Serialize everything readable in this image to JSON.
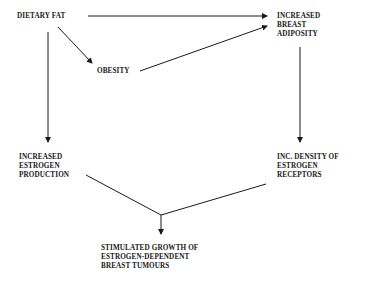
{
  "diagram": {
    "type": "flowchart",
    "nodes": {
      "dietary_fat": {
        "lines": [
          "DIETARY FAT"
        ]
      },
      "obesity": {
        "lines": [
          "OBESITY"
        ]
      },
      "breast_adiposity": {
        "lines": [
          "INCREASED",
          "BREAST",
          "ADIPOSITY"
        ]
      },
      "estrogen_production": {
        "lines": [
          "INCREASED",
          "ESTROGEN",
          "PRODUCTION"
        ]
      },
      "receptor_density": {
        "lines": [
          "INC. DENSITY OF",
          "ESTROGEN",
          "RECEPTORS"
        ]
      },
      "tumour_growth": {
        "lines": [
          "STIMULATED GROWTH OF",
          "ESTROGEN-DEPENDENT",
          "BREAST TUMOURS"
        ]
      }
    },
    "edges": [
      {
        "from": "DIETARY FAT",
        "to": "INCREASED BREAST ADIPOSITY"
      },
      {
        "from": "DIETARY FAT",
        "to": "OBESITY"
      },
      {
        "from": "OBESITY",
        "to": "INCREASED BREAST ADIPOSITY"
      },
      {
        "from": "DIETARY FAT",
        "to": "INCREASED ESTROGEN PRODUCTION"
      },
      {
        "from": "INCREASED BREAST ADIPOSITY",
        "to": "INC. DENSITY OF ESTROGEN RECEPTORS"
      },
      {
        "from": "INCREASED ESTROGEN PRODUCTION",
        "to": "STIMULATED GROWTH OF ESTROGEN-DEPENDENT BREAST TUMOURS",
        "note": "converges"
      },
      {
        "from": "INC. DENSITY OF ESTROGEN RECEPTORS",
        "to": "STIMULATED GROWTH OF ESTROGEN-DEPENDENT BREAST TUMOURS",
        "note": "converges"
      }
    ],
    "colors": {
      "ink": "#1a1a1a",
      "background": "#ffffff"
    }
  }
}
